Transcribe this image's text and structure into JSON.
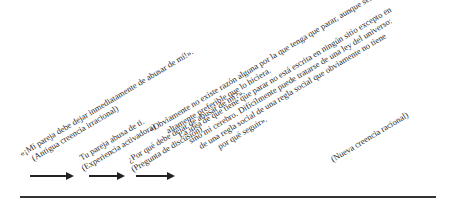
{
  "diagram": {
    "steps": [
      {
        "id": "old-belief",
        "lines": [
          "«¡Mi pareja debe dejar inmediatamente de abusar de mí!».",
          "(Antigua creencia irracional)"
        ]
      },
      {
        "id": "activating-experience",
        "lines": [
          "Tu pareja abusa de ti.",
          "(Experiencia activadora)"
        ]
      },
      {
        "id": "discussion-question",
        "lines": [
          "¿Por qué debe dejar de abusar de mí?».",
          "(Pregunta de discusión)"
        ]
      },
      {
        "id": "new-belief",
        "lines": [
          "«Obviamente no existe razón alguna por la que tenga que parar, aunque sería",
          "altamente preferible que lo hiciera.",
          "La idea de que tiene que parar no está escrita en ningún sitio excepto en",
          "sino mi cerebro. Difícilmente puede tratarse de una ley del universo:",
          "de una regla social de una regla social que obviamente no tiene",
          "por qué seguir»."
        ],
        "label": "(Nueva creencia racional)"
      }
    ],
    "arrows": 3,
    "colors": {
      "ink": "#222222",
      "background": "#ffffff"
    }
  }
}
